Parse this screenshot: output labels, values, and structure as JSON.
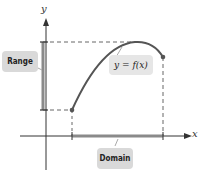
{
  "diagram": {
    "axis_labels": {
      "x": "x",
      "y": "y"
    },
    "function_label": "y = f(x)",
    "range_label": "Range",
    "domain_label": "Domain",
    "colors": {
      "curve": "#555555",
      "axis": "#333333",
      "bar": "#777777",
      "callout_bg": "#d9d9d9",
      "dashed": "#666666"
    }
  }
}
